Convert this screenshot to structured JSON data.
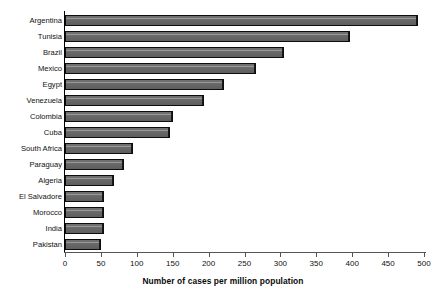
{
  "chart_data": {
    "type": "bar",
    "orientation": "horizontal",
    "title": "",
    "xlabel": "Number of cases per million population",
    "ylabel": "",
    "xlim": [
      0,
      500
    ],
    "xticks": [
      0,
      50,
      100,
      150,
      200,
      250,
      300,
      350,
      400,
      450,
      500
    ],
    "grid": false,
    "legend": null,
    "categories": [
      "Argentina",
      "Tunisia",
      "Brazil",
      "Mexico",
      "Egypt",
      "Venezuela",
      "Colombia",
      "Cuba",
      "South Africa",
      "Paraguay",
      "Algeria",
      "El Salvadore",
      "Morocco",
      "India",
      "Pakistan"
    ],
    "values": [
      492,
      397,
      305,
      266,
      221,
      194,
      150,
      146,
      95,
      82,
      68,
      55,
      55,
      55,
      50
    ],
    "bar_color": "#6f6f6f",
    "bar_edge_color": "#0d0d0d",
    "axis_color": "#555555",
    "background_color": "#ffffff"
  },
  "axis": {
    "x_title": "Number of cases per million population",
    "tick_labels": [
      "0",
      "50",
      "100",
      "150",
      "200",
      "250",
      "300",
      "350",
      "400",
      "450",
      "500"
    ]
  }
}
